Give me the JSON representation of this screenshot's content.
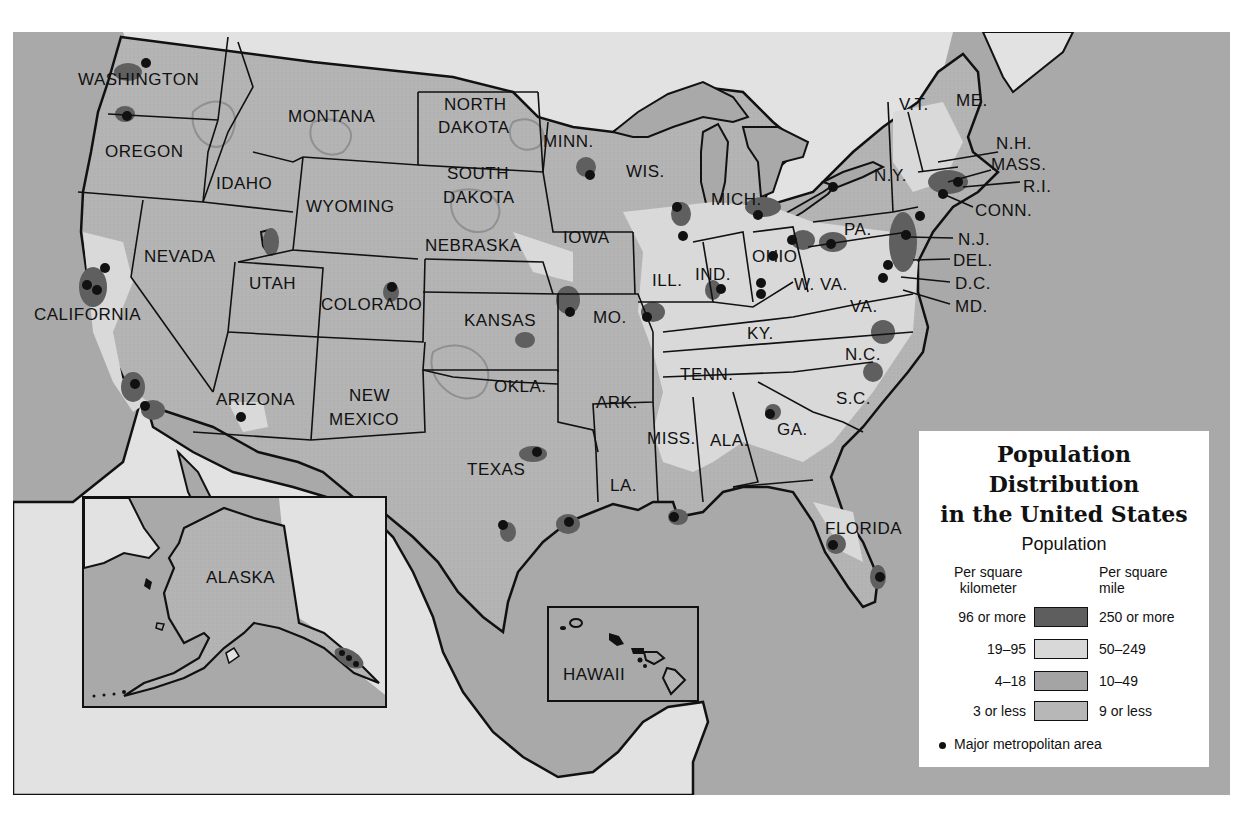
{
  "title": {
    "line1": "Population",
    "line2": "Distribution",
    "line3": "in the United States"
  },
  "legend": {
    "subtitle": "Population",
    "col_left": "Per square kilometer",
    "col_left_l1": "Per square",
    "col_left_l2": "kilometer",
    "col_right_l1": "Per square",
    "col_right_l2": "mile",
    "items": [
      {
        "km": "96 or more",
        "mi": "250 or more",
        "color": "#5e5e5e"
      },
      {
        "km": "19–95",
        "mi": "50–249",
        "color": "#d8d8d8"
      },
      {
        "km": "4–18",
        "mi": "10–49",
        "color": "#a4a4a4"
      },
      {
        "km": "3 or less",
        "mi": "9 or less",
        "color": "#b7b7b7"
      }
    ],
    "metro_label": "Major metropolitan area"
  },
  "colors": {
    "water": "#a9a9a9",
    "foreign_land": "#e2e2e2",
    "sparse": "#b6b6b6",
    "low": "#a3a3a3",
    "medium": "#d9d9d9",
    "dense": "#5f5f5f",
    "border": "#111111"
  },
  "insets": {
    "alaska": "ALASKA",
    "hawaii": "HAWAII"
  },
  "states": [
    {
      "name": "WASHINGTON",
      "x": 65,
      "y": 38
    },
    {
      "name": "OREGON",
      "x": 92,
      "y": 110
    },
    {
      "name": "IDAHO",
      "x": 203,
      "y": 142
    },
    {
      "name": "MONTANA",
      "x": 275,
      "y": 75
    },
    {
      "name": "WYOMING",
      "x": 293,
      "y": 165
    },
    {
      "name": "NORTH",
      "x": 431,
      "y": 63
    },
    {
      "name": "DAKOTA",
      "x": 425,
      "y": 86
    },
    {
      "name": "SOUTH",
      "x": 434,
      "y": 132
    },
    {
      "name": "DAKOTA",
      "x": 430,
      "y": 156
    },
    {
      "name": "MINN.",
      "x": 530,
      "y": 100
    },
    {
      "name": "WIS.",
      "x": 613,
      "y": 130
    },
    {
      "name": "MICH.",
      "x": 698,
      "y": 158
    },
    {
      "name": "NEBRASKA",
      "x": 412,
      "y": 204
    },
    {
      "name": "IOWA",
      "x": 550,
      "y": 196
    },
    {
      "name": "NEVADA",
      "x": 131,
      "y": 215
    },
    {
      "name": "UTAH",
      "x": 236,
      "y": 242
    },
    {
      "name": "COLORADO",
      "x": 308,
      "y": 263
    },
    {
      "name": "CALIFORNIA",
      "x": 21,
      "y": 273
    },
    {
      "name": "KANSAS",
      "x": 451,
      "y": 279
    },
    {
      "name": "MO.",
      "x": 580,
      "y": 276
    },
    {
      "name": "ILL.",
      "x": 639,
      "y": 239
    },
    {
      "name": "IND.",
      "x": 682,
      "y": 233
    },
    {
      "name": "OHIO",
      "x": 739,
      "y": 215
    },
    {
      "name": "W. VA.",
      "x": 781,
      "y": 243
    },
    {
      "name": "VA.",
      "x": 837,
      "y": 265
    },
    {
      "name": "KY.",
      "x": 734,
      "y": 292
    },
    {
      "name": "PA.",
      "x": 831,
      "y": 188
    },
    {
      "name": "N.Y.",
      "x": 861,
      "y": 134
    },
    {
      "name": "V.T.",
      "x": 886,
      "y": 63
    },
    {
      "name": "ME.",
      "x": 943,
      "y": 59
    },
    {
      "name": "TENN.",
      "x": 667,
      "y": 333
    },
    {
      "name": "N.C.",
      "x": 832,
      "y": 313
    },
    {
      "name": "S.C.",
      "x": 823,
      "y": 357
    },
    {
      "name": "ARIZONA",
      "x": 203,
      "y": 358
    },
    {
      "name": "NEW",
      "x": 336,
      "y": 354
    },
    {
      "name": "MEXICO",
      "x": 316,
      "y": 378
    },
    {
      "name": "OKLA.",
      "x": 481,
      "y": 345
    },
    {
      "name": "ARK.",
      "x": 583,
      "y": 361
    },
    {
      "name": "MISS.",
      "x": 634,
      "y": 397
    },
    {
      "name": "ALA.",
      "x": 697,
      "y": 399
    },
    {
      "name": "GA.",
      "x": 764,
      "y": 388
    },
    {
      "name": "TEXAS",
      "x": 454,
      "y": 428
    },
    {
      "name": "LA.",
      "x": 597,
      "y": 444
    },
    {
      "name": "FLORIDA",
      "x": 812,
      "y": 487
    }
  ],
  "northeast_labels": [
    {
      "name": "N.H.",
      "x": 983,
      "y": 102
    },
    {
      "name": "MASS.",
      "x": 978,
      "y": 123
    },
    {
      "name": "R.I.",
      "x": 1010,
      "y": 145
    },
    {
      "name": "CONN.",
      "x": 962,
      "y": 169
    },
    {
      "name": "N.J.",
      "x": 945,
      "y": 198
    },
    {
      "name": "DEL.",
      "x": 940,
      "y": 219
    },
    {
      "name": "D.C.",
      "x": 942,
      "y": 242
    },
    {
      "name": "MD.",
      "x": 942,
      "y": 265
    }
  ]
}
